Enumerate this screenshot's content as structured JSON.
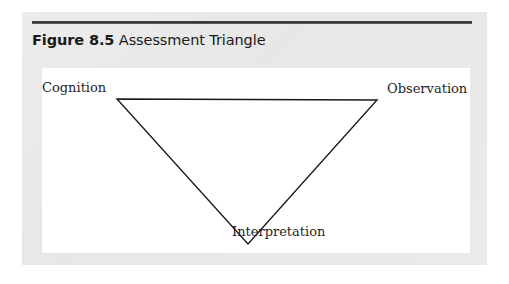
{
  "figure": {
    "number_label": "Figure 8.5",
    "title": "Assessment Triangle",
    "panel_background": "#e9e9e9",
    "canvas_background": "#ffffff",
    "rule_color": "#2f2f2f",
    "stroke_color": "#1a1a1a"
  },
  "diagram": {
    "type": "triangle",
    "orientation": "inverted",
    "vertices": [
      {
        "id": "cognition",
        "label": "Cognition",
        "position": "top-left",
        "x": 75,
        "y": 31
      },
      {
        "id": "observation",
        "label": "Observation",
        "position": "top-right",
        "x": 335,
        "y": 32
      },
      {
        "id": "interpretation",
        "label": "Interpretation",
        "position": "bottom-center",
        "x": 206,
        "y": 176
      }
    ],
    "edges": [
      {
        "from": "cognition",
        "to": "observation"
      },
      {
        "from": "observation",
        "to": "interpretation"
      },
      {
        "from": "interpretation",
        "to": "cognition"
      }
    ]
  }
}
